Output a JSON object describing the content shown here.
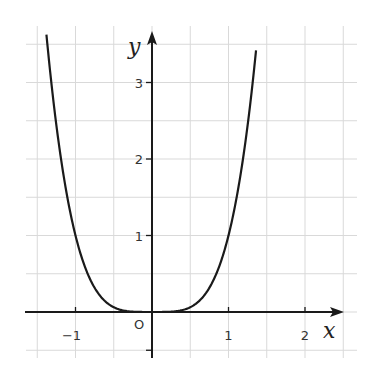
{
  "chart_data": {
    "type": "line",
    "title": "",
    "function": "y = x^4",
    "xlabel": "x",
    "ylabel": "y",
    "xlim": [
      -1.65,
      2.5
    ],
    "ylim": [
      -0.5,
      3.7
    ],
    "grid": true,
    "grid_step": 0.5,
    "x_ticks": [
      -1,
      1,
      2
    ],
    "x_tick_labels": [
      "−1",
      "1",
      "2"
    ],
    "y_ticks": [
      1,
      2,
      3
    ],
    "y_tick_labels": [
      "1",
      "2",
      "3"
    ],
    "origin_label": "O",
    "series": [
      {
        "name": "y = x^4",
        "x": [
          -1.38,
          -1.25,
          -1.0,
          -0.75,
          -0.5,
          -0.25,
          0,
          0.25,
          0.5,
          0.75,
          1.0,
          1.25,
          1.36
        ],
        "y": [
          3.63,
          2.44,
          1.0,
          0.32,
          0.06,
          0.004,
          0,
          0.004,
          0.06,
          0.32,
          1.0,
          2.44,
          3.42
        ]
      }
    ]
  },
  "colors": {
    "grid": "#d9d9d9",
    "axis": "#1a1a1a",
    "curve": "#1a1a1a"
  }
}
